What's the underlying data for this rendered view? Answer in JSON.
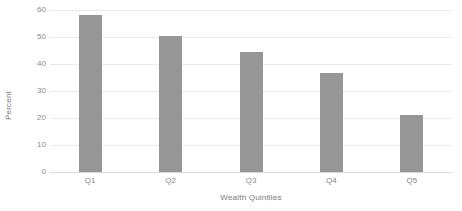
{
  "chart_data": {
    "type": "bar",
    "title": "",
    "subtitle": "",
    "xlabel": "Wealth Quintiles",
    "ylabel": "Percent",
    "categories": [
      "Q1",
      "Q2",
      "Q3",
      "Q4",
      "Q5"
    ],
    "values": [
      58,
      50.5,
      44.5,
      36.5,
      21
    ],
    "series": [
      {
        "name": "Percent",
        "values": [
          58,
          50.5,
          44.5,
          36.5,
          21
        ]
      }
    ],
    "ylim": [
      0,
      60
    ],
    "ytick_labels": [
      "60",
      "50",
      "40",
      "30",
      "20",
      "10",
      "0"
    ],
    "ytick_values": [
      60,
      50,
      40,
      30,
      20,
      10,
      0
    ],
    "grid": true,
    "grid_axis": "y",
    "legend": false,
    "legend_position": "none",
    "bar_color": "#969696",
    "grid_color": "#eaeaea",
    "axis_color": "#dcdcdc",
    "text_color": "#8a8a8a",
    "background_color": "#ffffff"
  }
}
